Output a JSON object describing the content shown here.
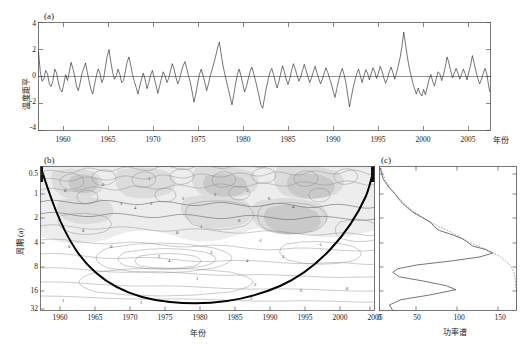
{
  "figure": {
    "background": "#ffffff",
    "ink": "#1a1a1a"
  },
  "panels": {
    "a": {
      "label": "(a)",
      "ylabel": "温度距平",
      "xlabel": "年份",
      "yticks": [
        "4",
        "2",
        "0",
        "-2",
        "-4"
      ],
      "xticks": [
        "1960",
        "1965",
        "1970",
        "1975",
        "1980",
        "1985",
        "1990",
        "1995",
        "2000",
        "2005"
      ]
    },
    "b": {
      "label": "(b)",
      "ylabel": "周期 (a)",
      "xlabel": "年份",
      "yticks": [
        "0.5",
        "1",
        "2",
        "4",
        "8",
        "16",
        "32"
      ],
      "xticks": [
        "1960",
        "1965",
        "1970",
        "1975",
        "1980",
        "1985",
        "1990",
        "1995",
        "2000",
        "2005"
      ],
      "contour_labels": [
        "0",
        "1",
        "2",
        "3",
        "4",
        "5",
        "6",
        "-1"
      ]
    },
    "c": {
      "label": "(c)",
      "xlabel": "功率谱",
      "xticks": [
        "0",
        "50",
        "100",
        "150"
      ]
    }
  },
  "chart_data": [
    {
      "type": "line",
      "panel": "a",
      "title": "(a)",
      "xlabel": "年份",
      "ylabel": "温度距平",
      "xlim": [
        1958,
        2008
      ],
      "ylim": [
        -4,
        4
      ],
      "xticks": [
        1960,
        1965,
        1970,
        1975,
        1980,
        1985,
        1990,
        1995,
        2000,
        2005
      ],
      "yticks": [
        -4,
        -2,
        0,
        2,
        4
      ],
      "grid": false,
      "legend": "none",
      "reference_line": 0,
      "series": [
        {
          "name": "温度距平",
          "x": [
            1958.0,
            1958.2,
            1958.4,
            1958.6,
            1958.8,
            1959.0,
            1959.2,
            1959.4,
            1959.6,
            1959.8,
            1960.0,
            1960.2,
            1960.4,
            1960.6,
            1960.8,
            1961.0,
            1961.2,
            1961.4,
            1961.6,
            1961.8,
            1962.0,
            1962.2,
            1962.4,
            1962.6,
            1962.8,
            1963.0,
            1963.2,
            1963.4,
            1963.6,
            1963.8,
            1964.0,
            1964.2,
            1964.4,
            1964.6,
            1964.8,
            1965.0,
            1965.2,
            1965.4,
            1965.6,
            1965.8,
            1966.0,
            1966.2,
            1966.4,
            1966.6,
            1966.8,
            1967.0,
            1967.2,
            1967.4,
            1967.6,
            1967.8,
            1968.0,
            1968.2,
            1968.4,
            1968.6,
            1968.8,
            1969.0,
            1969.2,
            1969.4,
            1969.6,
            1969.8,
            1970.0,
            1970.2,
            1970.4,
            1970.6,
            1970.8,
            1971.0,
            1971.2,
            1971.4,
            1971.6,
            1971.8,
            1972.0,
            1972.2,
            1972.4,
            1972.6,
            1972.8,
            1973.0,
            1973.2,
            1973.4,
            1973.6,
            1973.8,
            1974.0,
            1974.2,
            1974.4,
            1974.6,
            1974.8,
            1975.0,
            1975.2,
            1975.4,
            1975.6,
            1975.8,
            1976.0,
            1976.2,
            1976.4,
            1976.6,
            1976.8,
            1977.0,
            1977.2,
            1977.4,
            1977.6,
            1977.8,
            1978.0,
            1978.2,
            1978.4,
            1978.6,
            1978.8,
            1979.0,
            1979.2,
            1979.4,
            1979.6,
            1979.8,
            1980.0,
            1980.2,
            1980.4,
            1980.6,
            1980.8,
            1981.0,
            1981.2,
            1981.4,
            1981.6,
            1981.8,
            1982.0,
            1982.2,
            1982.4,
            1982.6,
            1982.8,
            1983.0,
            1983.2,
            1983.4,
            1983.6,
            1983.8,
            1984.0,
            1984.2,
            1984.4,
            1984.6,
            1984.8,
            1985.0,
            1985.2,
            1985.4,
            1985.6,
            1985.8,
            1986.0,
            1986.2,
            1986.4,
            1986.6,
            1986.8,
            1987.0,
            1987.2,
            1987.4,
            1987.6,
            1987.8,
            1988.0,
            1988.2,
            1988.4,
            1988.6,
            1988.8,
            1989.0,
            1989.2,
            1989.4,
            1989.6,
            1989.8,
            1990.0,
            1990.2,
            1990.4,
            1990.6,
            1990.8,
            1991.0,
            1991.2,
            1991.4,
            1991.6,
            1991.8,
            1992.0,
            1992.2,
            1992.4,
            1992.6,
            1992.8,
            1993.0,
            1993.2,
            1993.4,
            1993.6,
            1993.8,
            1994.0,
            1994.2,
            1994.4,
            1994.6,
            1994.8,
            1995.0,
            1995.2,
            1995.4,
            1995.6,
            1995.8,
            1996.0,
            1996.2,
            1996.4,
            1996.6,
            1996.8,
            1997.0,
            1997.2,
            1997.4,
            1997.6,
            1997.8,
            1998.0,
            1998.2,
            1998.4,
            1998.6,
            1998.8,
            1999.0,
            1999.2,
            1999.4,
            1999.6,
            1999.8,
            2000.0,
            2000.2,
            2000.4,
            2000.6,
            2000.8,
            2001.0,
            2001.2,
            2001.4,
            2001.6,
            2001.8,
            2002.0,
            2002.2,
            2002.4,
            2002.6,
            2002.8,
            2003.0,
            2003.2,
            2003.4,
            2003.6,
            2003.8,
            2004.0,
            2004.2,
            2004.4,
            2004.6,
            2004.8,
            2005.0,
            2005.2,
            2005.4,
            2005.6,
            2005.8,
            2006.0,
            2006.2,
            2006.4,
            2006.6,
            2006.8,
            2007.0,
            2007.2,
            2007.4,
            2007.6,
            2007.9
          ],
          "y": [
            1.85,
            0.35,
            -0.35,
            -0.15,
            0.45,
            0.2,
            -0.55,
            -0.75,
            -0.3,
            0.55,
            0.25,
            -0.45,
            -0.95,
            -1.15,
            -0.55,
            0.15,
            -0.3,
            0.3,
            1.05,
            0.6,
            0.05,
            -0.7,
            -1.05,
            -0.5,
            0.2,
            0.6,
            1.0,
            0.3,
            -0.35,
            -0.95,
            -1.3,
            -0.6,
            0.05,
            0.55,
            0.25,
            -0.45,
            -0.15,
            0.7,
            1.5,
            2.0,
            1.1,
            0.3,
            -0.2,
            0.05,
            0.55,
            0.15,
            -0.45,
            -0.3,
            0.35,
            1.05,
            1.45,
            0.85,
            0.15,
            -0.35,
            -0.8,
            -1.3,
            -0.7,
            -0.2,
            0.25,
            -0.25,
            -0.9,
            -0.45,
            0.1,
            0.45,
            -0.1,
            -0.65,
            -1.25,
            -0.7,
            -0.15,
            0.35,
            0.05,
            -0.45,
            -0.15,
            0.4,
            0.95,
            0.55,
            -0.05,
            -0.55,
            -0.2,
            0.35,
            0.8,
            1.1,
            0.6,
            0.05,
            -0.45,
            -1.15,
            -1.9,
            -1.3,
            -0.55,
            0.15,
            0.55,
            0.1,
            -0.45,
            -1.05,
            -0.55,
            0.05,
            0.5,
            1.0,
            1.5,
            2.1,
            2.55,
            1.7,
            0.85,
            0.2,
            -0.35,
            -0.95,
            -1.5,
            -2.1,
            -1.35,
            -0.55,
            0.15,
            0.55,
            0.05,
            -0.55,
            -1.15,
            -0.75,
            -0.2,
            0.35,
            0.7,
            0.25,
            -0.3,
            -0.85,
            -1.45,
            -2.1,
            -2.35,
            -1.6,
            -0.85,
            -0.25,
            0.3,
            0.6,
            0.15,
            -0.4,
            -0.85,
            -0.35,
            0.25,
            0.8,
            0.35,
            -0.2,
            -0.6,
            -0.15,
            0.45,
            0.95,
            0.55,
            0.1,
            -0.35,
            -0.05,
            0.45,
            0.9,
            0.45,
            0.0,
            -0.45,
            -0.1,
            0.35,
            0.75,
            0.3,
            -0.15,
            -0.55,
            -0.2,
            0.25,
            0.65,
            0.3,
            -0.15,
            -0.55,
            -1.1,
            -1.55,
            -0.9,
            -0.3,
            0.2,
            0.6,
            0.15,
            -0.45,
            -1.35,
            -2.25,
            -1.55,
            -0.85,
            -0.3,
            0.2,
            0.55,
            0.05,
            -0.45,
            0.05,
            0.5,
            0.25,
            -0.25,
            0.2,
            0.65,
            0.35,
            -0.15,
            0.25,
            0.75,
            0.4,
            -0.1,
            -0.5,
            -0.15,
            0.35,
            0.7,
            0.3,
            -0.2,
            0.25,
            0.8,
            1.4,
            2.2,
            3.3,
            2.4,
            1.45,
            0.7,
            0.1,
            -0.45,
            -0.9,
            -1.3,
            -0.85,
            -1.25,
            -1.45,
            -0.95,
            -1.35,
            -0.8,
            -0.25,
            0.15,
            -0.35,
            -0.7,
            -0.15,
            0.35,
            0.2,
            -0.3,
            0.15,
            0.7,
            1.45,
            1.0,
            0.4,
            -0.1,
            0.25,
            0.6,
            0.25,
            -0.2,
            0.15,
            0.55,
            0.2,
            -0.25,
            0.3,
            0.85,
            1.55,
            0.95,
            0.35,
            -0.15,
            -0.55,
            -0.2,
            0.25,
            0.6,
            0.15,
            -1.1
          ]
        }
      ]
    },
    {
      "type": "heatmap",
      "panel": "b",
      "title": "(b)",
      "xlabel": "年份",
      "ylabel": "周期 (a)",
      "xlim": [
        1958,
        2008
      ],
      "ylim_period_years": [
        0.4,
        32
      ],
      "yscale": "log2",
      "xticks": [
        1960,
        1965,
        1970,
        1975,
        1980,
        1985,
        1990,
        1995,
        2000,
        2005
      ],
      "yticks": [
        0.5,
        1,
        2,
        4,
        8,
        16,
        32
      ],
      "description": "小波功率谱 (wavelet power spectrum) with cone of influence",
      "contour_levels": [
        -1,
        0,
        1,
        2,
        3,
        4,
        5,
        6
      ],
      "cone_of_influence": true,
      "shading": "grayscale"
    },
    {
      "type": "line",
      "panel": "c",
      "title": "(c)",
      "xlabel": "功率谱",
      "ylabel": "",
      "xlim": [
        0,
        165
      ],
      "ylim_period_years": [
        0.4,
        32
      ],
      "yscale": "log2",
      "xticks": [
        0,
        50,
        100,
        150
      ],
      "grid": false,
      "series": [
        {
          "name": "全局小波谱",
          "period": [
            0.42,
            0.5,
            0.6,
            0.75,
            0.9,
            1.1,
            1.3,
            1.6,
            1.9,
            2.2,
            2.5,
            2.8,
            3.2,
            3.6,
            4.0,
            4.5,
            5.0,
            5.6,
            6.3,
            7.1,
            8.0,
            9.0,
            10.0,
            11.5,
            13.0,
            15.0,
            17.0,
            20.0,
            23.0,
            27.0,
            32.0
          ],
          "power": [
            1.0,
            2.5,
            5.0,
            11.0,
            18.0,
            24.0,
            30.0,
            40.0,
            52.0,
            62.0,
            66.0,
            72.0,
            88.0,
            100.0,
            106.0,
            112.0,
            128.0,
            136.0,
            120.0,
            86.0,
            45.0,
            22.0,
            16.0,
            24.0,
            52.0,
            80.0,
            92.0,
            60.0,
            26.0,
            12.0,
            16.0
          ]
        },
        {
          "name": "95%置信度",
          "period": [
            0.42,
            0.5,
            0.6,
            0.75,
            0.9,
            1.1,
            1.3,
            1.6,
            1.9,
            2.2,
            2.5,
            2.8,
            3.2,
            3.6,
            4.0,
            4.5,
            5.0,
            5.6,
            6.3,
            7.1,
            8.0,
            9.0,
            10.0,
            11.5,
            13.0,
            15.0,
            17.0,
            20.0,
            23.0,
            27.0,
            32.0
          ],
          "power": [
            2.0,
            4.0,
            7.0,
            12.0,
            18.0,
            25.0,
            32.0,
            42.0,
            52.0,
            62.0,
            72.0,
            82.0,
            92.0,
            100.0,
            108.0,
            118.0,
            128.0,
            138.0,
            146.0,
            152.0,
            157.0,
            160.0,
            162.0,
            163.0,
            164.0,
            164.0,
            165.0,
            165.0,
            165.0,
            165.0,
            165.0
          ]
        }
      ]
    }
  ]
}
